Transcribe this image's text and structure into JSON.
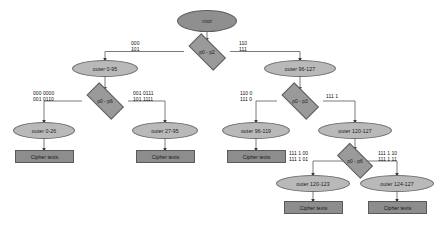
{
  "diagram": {
    "type": "decision-tree",
    "colors": {
      "root_fill": "#8f8f8f",
      "ellipse_fill": "#b9b9b9",
      "diamond_fill": "#9a9a9a",
      "box_fill": "#8d8d8d",
      "edge_stroke": "#6b6b6b",
      "background": "#ffffff"
    },
    "nodes": {
      "root": {
        "label": "root",
        "shape": "ellipse"
      },
      "d_root": {
        "label": "p0 - p2",
        "shape": "diamond"
      },
      "outer_0_95": {
        "label": "outer 0-95",
        "shape": "ellipse"
      },
      "outer_96_127": {
        "label": "outer 96-127",
        "shape": "ellipse"
      },
      "d_left": {
        "label": "p0 - p6",
        "shape": "diamond"
      },
      "d_right": {
        "label": "p0 - p3",
        "shape": "diamond"
      },
      "outer_0_26": {
        "label": "outer 0-26",
        "shape": "ellipse"
      },
      "outer_27_95": {
        "label": "outer 27-95",
        "shape": "ellipse"
      },
      "outer_96_119": {
        "label": "outer 96-119",
        "shape": "ellipse"
      },
      "outer_120_127": {
        "label": "outer 120-127",
        "shape": "ellipse"
      },
      "d_bottom": {
        "label": "p0 - p6",
        "shape": "diamond"
      },
      "outer_120_123": {
        "label": "outer 120-123",
        "shape": "ellipse"
      },
      "outer_124_127": {
        "label": "outer 124-127",
        "shape": "ellipse"
      },
      "cipher_1": {
        "label": "Cipher texts",
        "shape": "box"
      },
      "cipher_2": {
        "label": "Cipher texts",
        "shape": "box"
      },
      "cipher_3": {
        "label": "Cipher texts",
        "shape": "box"
      },
      "cipher_4": {
        "label": "Cipher texts",
        "shape": "box"
      },
      "cipher_5": {
        "label": "Cipher texts",
        "shape": "box"
      }
    },
    "edge_labels": {
      "root_left": {
        "line1": "000",
        "line2": "101"
      },
      "root_right": {
        "line1": "110",
        "line2": "111"
      },
      "left_left": {
        "line1": "000 0000",
        "line2": "001 0110"
      },
      "left_right": {
        "line1": "001 0111",
        "line2": "101 1111"
      },
      "right_left": {
        "line1": "110 0",
        "line2": "111 0"
      },
      "right_right": {
        "line1": "111 1",
        "line2": ""
      },
      "bottom_left": {
        "line1": "111 1 00",
        "line2": "111 1 01"
      },
      "bottom_right": {
        "line1": "111 1 10",
        "line2": "111 1 11"
      }
    }
  }
}
